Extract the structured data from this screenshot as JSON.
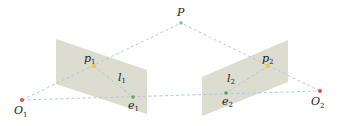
{
  "diagram": {
    "colors": {
      "plane": "#d8d8cc",
      "dashed_line": "#a9c4dc",
      "point_P": "#8aaed0",
      "camera_center": "#e05040",
      "image_point": "#f2c84a",
      "epipole": "#4caf50",
      "label": "#222222"
    },
    "points": {
      "P": {
        "label": "P",
        "sub": "",
        "x": 181,
        "y": 23
      },
      "O1": {
        "label": "O",
        "sub": "1",
        "x": 22,
        "y": 100
      },
      "O2": {
        "label": "O",
        "sub": "2",
        "x": 320,
        "y": 91
      },
      "p1": {
        "label": "p",
        "sub": "1",
        "x": 94,
        "y": 66
      },
      "p2": {
        "label": "p",
        "sub": "2",
        "x": 268,
        "y": 66
      },
      "e1": {
        "label": "e",
        "sub": "1",
        "x": 133,
        "y": 97
      },
      "e2": {
        "label": "e",
        "sub": "2",
        "x": 226,
        "y": 93
      }
    },
    "lines": {
      "l1": {
        "label": "l",
        "sub": "1"
      },
      "l2": {
        "label": "l",
        "sub": "2"
      }
    },
    "planes": {
      "left": "image-plane-1",
      "right": "image-plane-2"
    }
  }
}
